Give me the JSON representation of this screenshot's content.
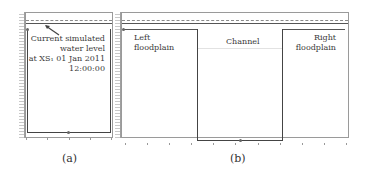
{
  "panels": [
    {
      "id": "a",
      "caption": "(a)",
      "title": "",
      "annotation": {
        "line1": "Current simulated",
        "line2": "water level",
        "line3": "at XS₁ 01 Jan 2011",
        "line4": "12:00:00"
      },
      "x_ticks": [
        "",
        "",
        "",
        "",
        ""
      ]
    },
    {
      "id": "b",
      "caption": "(b)",
      "title": "",
      "regions": {
        "left": {
          "line1": "Left",
          "line2": "floodplain"
        },
        "channel": "Channel",
        "right": {
          "line1": "Right",
          "line2": "floodplain"
        }
      },
      "x_ticks": [
        "",
        "",
        "",
        "",
        "",
        "",
        "",
        "",
        "",
        "",
        ""
      ]
    }
  ],
  "colors": {
    "frame": "#9a9a9a",
    "cross_section": "#444444",
    "water_level": "#8a8a8a",
    "text": "#3a3a3a"
  }
}
